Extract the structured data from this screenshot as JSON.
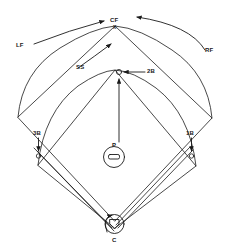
{
  "diagram": {
    "type": "baseball-field-diagram",
    "background_color": "#ffffff",
    "line_color": "#1a1a1a",
    "labels": {
      "left_field": "LF",
      "center_field": "CF",
      "center_field_mark": "X",
      "right_field": "RF",
      "shortstop": "SS",
      "second_base": "2B",
      "third_base": "3B",
      "first_base": "1B",
      "pitcher": "P",
      "catcher": "C"
    },
    "markers": {
      "second_base_marker": "circle",
      "third_base_marker": "circle",
      "first_base_marker": "circle",
      "pitcher_mound": "circle-with-rubber",
      "home_plate": "home-plate-pentagon",
      "catcher_circle": "circle"
    },
    "arrows": [
      {
        "name": "lf-arrow",
        "from": "LF",
        "to": "outfield-arc-left"
      },
      {
        "name": "rf-arrow",
        "from": "RF",
        "to": "outfield-arc-right"
      },
      {
        "name": "ss-arrow",
        "from": "SS",
        "to": "outfield-arc-apex"
      },
      {
        "name": "2b-arrow",
        "from": "2B",
        "to": "second-base-marker"
      },
      {
        "name": "p-arrow",
        "from": "P",
        "to": "second-base-marker"
      },
      {
        "name": "3b-arrow",
        "from": "3B",
        "to": "third-base-marker"
      },
      {
        "name": "1b-arrow",
        "from": "1B",
        "to": "first-base-marker"
      },
      {
        "name": "c-arrow",
        "from": "C",
        "to": "home-plate"
      }
    ]
  }
}
